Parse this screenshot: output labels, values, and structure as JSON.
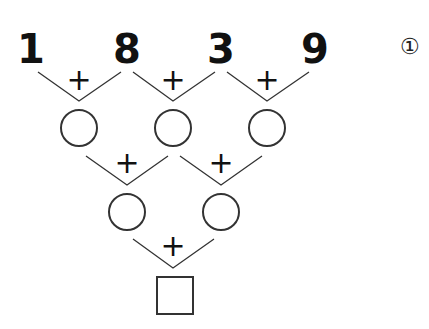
{
  "problem": {
    "label": "①",
    "top_numbers": [
      "1",
      "8",
      "3",
      "9"
    ],
    "operator": "+",
    "rows": [
      {
        "blanks": 3,
        "shape": "circle"
      },
      {
        "blanks": 2,
        "shape": "circle"
      },
      {
        "blanks": 1,
        "shape": "square"
      }
    ]
  },
  "colors": {
    "ink": "#111111",
    "line": "#333333",
    "background": "#ffffff"
  }
}
